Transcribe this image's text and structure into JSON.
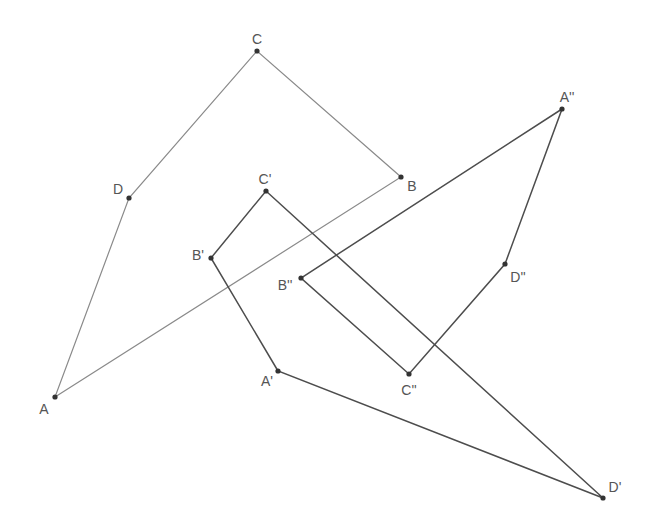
{
  "diagram": {
    "colors": {
      "line_original": "#8a8a8a",
      "line_image": "#4d4d4d",
      "point": "#333333",
      "label": "#555555"
    },
    "points": [
      {
        "id": "A",
        "label": "A",
        "x": 55,
        "y": 397,
        "lx": 44,
        "ly": 414
      },
      {
        "id": "B",
        "label": "B",
        "x": 401,
        "y": 177,
        "lx": 412,
        "ly": 191
      },
      {
        "id": "C",
        "label": "C",
        "x": 257,
        "y": 51,
        "lx": 257,
        "ly": 44
      },
      {
        "id": "D",
        "label": "D",
        "x": 129,
        "y": 198,
        "lx": 118,
        "ly": 194
      },
      {
        "id": "A1",
        "label": "A'",
        "x": 278,
        "y": 371,
        "lx": 267,
        "ly": 386
      },
      {
        "id": "B1",
        "label": "B'",
        "x": 211,
        "y": 258,
        "lx": 198,
        "ly": 260
      },
      {
        "id": "C1",
        "label": "C'",
        "x": 266,
        "y": 191,
        "lx": 265,
        "ly": 184
      },
      {
        "id": "D1",
        "label": "D'",
        "x": 603,
        "y": 498,
        "lx": 615,
        "ly": 492
      },
      {
        "id": "A2",
        "label": "A''",
        "x": 562,
        "y": 109,
        "lx": 567,
        "ly": 102
      },
      {
        "id": "B2",
        "label": "B''",
        "x": 301,
        "y": 278,
        "lx": 285,
        "ly": 290
      },
      {
        "id": "C2",
        "label": "C''",
        "x": 409,
        "y": 374,
        "lx": 409,
        "ly": 395
      },
      {
        "id": "D2",
        "label": "D''",
        "x": 505,
        "y": 264,
        "lx": 518,
        "ly": 282
      }
    ],
    "polygons": [
      {
        "name": "ABCD",
        "vertices": [
          "A",
          "B",
          "C",
          "D"
        ],
        "style": "original"
      },
      {
        "name": "A'B'C'D'",
        "vertices": [
          "A1",
          "B1",
          "C1",
          "D1"
        ],
        "style": "image"
      },
      {
        "name": "A''B''C''D''",
        "vertices": [
          "A2",
          "B2",
          "C2",
          "D2"
        ],
        "style": "image"
      }
    ]
  }
}
